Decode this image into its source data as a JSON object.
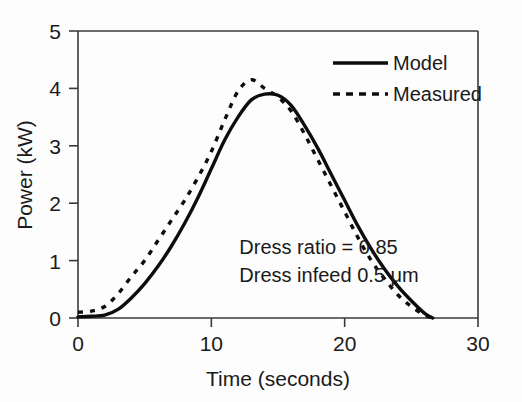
{
  "chart_data": {
    "type": "line",
    "title": "",
    "xlabel": "Time (seconds)",
    "ylabel": "Power (kW)",
    "xlim": [
      0,
      30
    ],
    "ylim": [
      0,
      5
    ],
    "xticks": [
      0,
      10,
      20,
      30
    ],
    "yticks": [
      0,
      1,
      2,
      3,
      4,
      5
    ],
    "xtick_labels": [
      "0",
      "10",
      "20",
      "30"
    ],
    "ytick_labels": [
      "0",
      "1",
      "2",
      "3",
      "4",
      "5"
    ],
    "grid": false,
    "legend_position": "top-right",
    "series": [
      {
        "name": "Model",
        "style": "solid",
        "color": "#0d0d0d",
        "x": [
          0,
          1,
          2,
          3,
          4,
          5,
          6,
          7,
          8,
          9,
          10,
          11,
          12,
          13,
          14,
          15,
          16,
          17,
          18,
          19,
          20,
          21,
          22,
          23,
          24,
          25,
          26,
          26.6
        ],
        "y": [
          0.02,
          0.03,
          0.05,
          0.15,
          0.35,
          0.6,
          0.9,
          1.25,
          1.65,
          2.1,
          2.6,
          3.1,
          3.5,
          3.8,
          3.9,
          3.88,
          3.7,
          3.35,
          2.95,
          2.5,
          2.05,
          1.6,
          1.2,
          0.85,
          0.55,
          0.3,
          0.08,
          0.0
        ]
      },
      {
        "name": "Measured",
        "style": "dashed",
        "color": "#0d0d0d",
        "x": [
          0,
          1,
          2,
          3,
          4,
          5,
          6,
          7,
          8,
          9,
          10,
          11,
          12,
          13,
          14,
          15,
          16,
          17,
          18,
          19,
          20,
          21,
          22,
          23,
          24,
          25,
          26,
          26.6
        ],
        "y": [
          0.1,
          0.12,
          0.2,
          0.42,
          0.72,
          1.0,
          1.35,
          1.7,
          2.05,
          2.45,
          2.9,
          3.45,
          3.95,
          4.15,
          4.0,
          3.85,
          3.6,
          3.2,
          2.75,
          2.3,
          1.85,
          1.4,
          1.0,
          0.68,
          0.4,
          0.2,
          0.05,
          0.0
        ]
      }
    ],
    "annotations": [
      {
        "text": "Dress ratio = 0.85",
        "x": 12.1,
        "y": 1.12
      },
      {
        "text": "Dress infeed 0.5 μm",
        "x": 12.1,
        "y": 0.62
      }
    ]
  },
  "legend": {
    "entries": [
      {
        "label": "Model",
        "style": "solid"
      },
      {
        "label": "Measured",
        "style": "dashed"
      }
    ]
  }
}
